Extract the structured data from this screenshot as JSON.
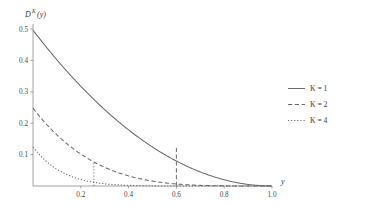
{
  "chart_data": {
    "type": "line",
    "title": "",
    "ylabel": "D^K(y)",
    "xlabel": "y",
    "xlim": [
      0,
      1.0
    ],
    "ylim": [
      0,
      0.52
    ],
    "grid": false,
    "legend_position": "right",
    "xticks": [
      "0.2",
      "0.4",
      "0.6",
      "0.8",
      "1.0"
    ],
    "xtick_values": [
      0.2,
      0.4,
      0.6,
      0.8,
      1.0
    ],
    "yticks": [
      "0.1",
      "0.2",
      "0.3",
      "0.4",
      "0.5"
    ],
    "ytick_values": [
      0.1,
      0.2,
      0.3,
      0.4,
      0.5
    ],
    "x": [
      0.0,
      0.05,
      0.1,
      0.15,
      0.2,
      0.25,
      0.3,
      0.35,
      0.4,
      0.45,
      0.5,
      0.55,
      0.6,
      0.65,
      0.7,
      0.75,
      0.8,
      0.85,
      0.9,
      0.95,
      1.0
    ],
    "series": [
      {
        "name": "K = 1",
        "K": 1,
        "style": "solid",
        "values": [
          0.5,
          0.451,
          0.405,
          0.361,
          0.32,
          0.281,
          0.245,
          0.211,
          0.18,
          0.151,
          0.125,
          0.101,
          0.08,
          0.061,
          0.045,
          0.031,
          0.02,
          0.011,
          0.005,
          0.001,
          0.0
        ]
      },
      {
        "name": "K = 2",
        "K": 2,
        "style": "dashed",
        "values": [
          0.1667,
          0.1426,
          0.1215,
          0.1029,
          0.0867,
          0.0726,
          0.0605,
          0.05,
          0.0411,
          0.0335,
          0.027,
          0.0216,
          0.0171,
          0.0133,
          0.0102,
          0.0076,
          0.0055,
          0.0038,
          0.0024,
          0.0013,
          0.0
        ]
      },
      {
        "name": "K = 4",
        "K": 4,
        "style": "dotted",
        "values": [
          0.0333,
          0.0272,
          0.022,
          0.0176,
          0.0139,
          0.0108,
          0.0083,
          0.0063,
          0.0047,
          0.0034,
          0.0024,
          0.0016,
          0.0011,
          0.0007,
          0.0004,
          0.0002,
          0.0001,
          0.0001,
          0.0,
          0.0,
          0.0
        ]
      }
    ],
    "annotations": [
      {
        "name": "dropline-k1",
        "x": 0.5,
        "y": 0.125,
        "style": "dashed"
      },
      {
        "name": "dropline-k2",
        "x": 0.25,
        "y": 0.0726,
        "style": "dotted"
      }
    ]
  },
  "legend": {
    "entries": [
      {
        "label": "K = 1",
        "style": "solid"
      },
      {
        "label": "K = 2",
        "style": "dashed"
      },
      {
        "label": "K = 4",
        "style": "dotted"
      }
    ]
  },
  "labels": {
    "y_axis_title_base": "D",
    "y_axis_title_sup": "K",
    "y_axis_title_arg": "(y)",
    "x_axis_title": "y"
  }
}
